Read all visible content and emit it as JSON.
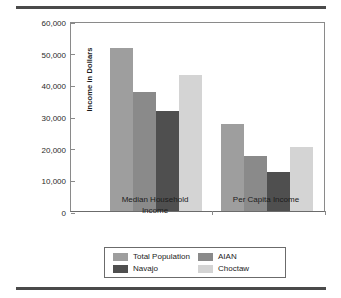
{
  "chart_data": {
    "type": "bar",
    "title": "",
    "subtitle": "",
    "xlabel": "",
    "ylabel": "Income in Dollars",
    "categories": [
      "Median Household Income",
      "Per Capita Income"
    ],
    "category_lines": [
      [
        "Median Household",
        "Income"
      ],
      [
        "Per Capita Income"
      ]
    ],
    "series": [
      {
        "name": "Total Population",
        "color": "#9e9e9e",
        "values": [
          51500,
          27500
        ]
      },
      {
        "name": "AIAN",
        "color": "#8a8a8a",
        "values": [
          37500,
          17500
        ]
      },
      {
        "name": "Navajo",
        "color": "#4f4f4f",
        "values": [
          31500,
          12200
        ]
      },
      {
        "name": "Choctaw",
        "color": "#d4d4d4",
        "values": [
          43000,
          20200
        ]
      }
    ],
    "ylim": [
      0,
      60000
    ],
    "ytick_values": [
      0,
      10000,
      20000,
      30000,
      40000,
      50000,
      60000
    ],
    "ytick_labels": [
      "0",
      "10,000",
      "20,000",
      "30,000",
      "40,000",
      "50,000",
      "60,000"
    ],
    "grid": false,
    "legend_position": "bottom",
    "legend_order": [
      "Total Population",
      "AIAN",
      "Navajo",
      "Choctaw"
    ]
  },
  "legend": {
    "entries": [
      {
        "label": "Total Population",
        "color": "#9e9e9e"
      },
      {
        "label": "AIAN",
        "color": "#8a8a8a"
      },
      {
        "label": "Navajo",
        "color": "#4f4f4f"
      },
      {
        "label": "Choctaw",
        "color": "#d4d4d4"
      }
    ]
  },
  "style": {
    "rule_color": "#4a4a4a",
    "axis_color": "#8a8a8a",
    "text_color": "#1c1c1c"
  }
}
